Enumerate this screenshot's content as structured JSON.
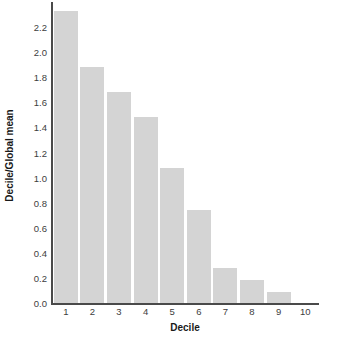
{
  "chart_data": {
    "type": "bar",
    "title": "",
    "xlabel": "Decile",
    "ylabel": "Decile/Global mean",
    "categories": [
      "1",
      "2",
      "3",
      "4",
      "5",
      "6",
      "7",
      "8",
      "9",
      "10"
    ],
    "values": [
      2.33,
      1.88,
      1.68,
      1.48,
      1.08,
      0.74,
      0.28,
      0.18,
      0.09,
      0.0
    ],
    "ylim": [
      0.0,
      2.4
    ],
    "yticks": [
      "0.0",
      "0.2",
      "0.4",
      "0.6",
      "0.8",
      "1.0",
      "1.2",
      "1.4",
      "1.6",
      "1.8",
      "2.0",
      "2.2"
    ],
    "ytick_values": [
      0.0,
      0.2,
      0.4,
      0.6,
      0.8,
      1.0,
      1.2,
      1.4,
      1.6,
      1.8,
      2.0,
      2.2
    ],
    "xticks": [
      "1",
      "2",
      "3",
      "4",
      "5",
      "6",
      "7",
      "8",
      "9",
      "10"
    ],
    "grid": false,
    "legend": null,
    "bar_color": "#d4d4d4",
    "axis_color": "#4a4a4a",
    "text_color": "#3d3d3d"
  }
}
